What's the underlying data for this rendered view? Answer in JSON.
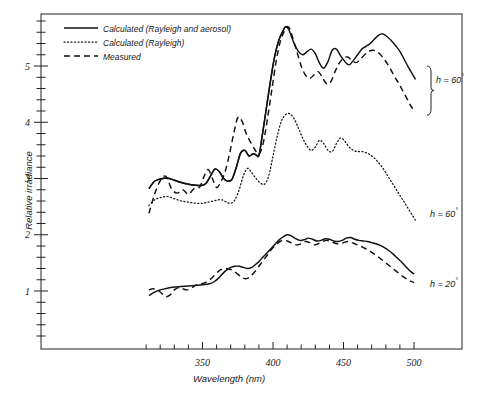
{
  "chart_data": {
    "type": "line",
    "title": "",
    "xlabel": "Wavelength (nm)",
    "ylabel": "Relative irradiance",
    "xlim": [
      310,
      505
    ],
    "ylim": [
      0,
      5.9
    ],
    "xticks_labeled": [
      350,
      400,
      450,
      500
    ],
    "xtick_labels": [
      "350",
      "400",
      "450",
      "500"
    ],
    "xtick_step_minor": 10,
    "yticks_labeled": [
      1,
      2,
      3,
      4,
      5
    ],
    "ytick_labels": [
      "1",
      "2",
      "3",
      "4",
      "5"
    ],
    "ytick_step_minor": 0.2,
    "grid": false,
    "legend_position": "top-left",
    "legend": [
      {
        "key": "calc_rayleigh_aerosol",
        "label": "Calculated (Rayleigh and  aerosol)",
        "style": "solid"
      },
      {
        "key": "calc_rayleigh",
        "label": "Calculated  (Rayleigh)",
        "style": "dotted"
      },
      {
        "key": "measured",
        "label": "Measured",
        "style": "dashed"
      }
    ],
    "annotations": [
      {
        "name": "group-label-top",
        "text": "h = 60",
        "superscript": "°",
        "bracket": true
      },
      {
        "name": "group-label-middle",
        "text": "h = 60",
        "superscript": "°",
        "bracket": false
      },
      {
        "name": "group-label-bottom",
        "text": "h = 20",
        "superscript": "°",
        "bracket": false
      }
    ],
    "series": [
      {
        "name": "h=60 Calculated (Rayleigh and aerosol)",
        "group": "h60-upper",
        "style": "solid",
        "x": [
          312,
          316,
          320,
          325,
          330,
          335,
          340,
          345,
          350,
          353,
          356,
          359,
          362,
          365,
          368,
          371,
          374,
          377,
          380,
          383,
          386,
          388,
          390,
          392,
          395,
          398,
          401,
          404,
          407,
          409,
          411,
          413,
          415,
          418,
          421,
          424,
          427,
          430,
          433,
          436,
          439,
          442,
          445,
          448,
          451,
          454,
          457,
          460,
          463,
          466,
          469,
          472,
          475,
          478,
          481,
          484,
          487,
          490,
          493,
          496,
          499,
          501
        ],
        "y": [
          2.82,
          2.95,
          2.99,
          3.01,
          2.97,
          2.93,
          2.9,
          2.88,
          2.88,
          2.93,
          3.06,
          3.17,
          3.12,
          3.0,
          2.95,
          2.99,
          3.2,
          3.45,
          3.5,
          3.4,
          3.44,
          3.42,
          3.41,
          3.7,
          4.2,
          4.7,
          5.15,
          5.45,
          5.62,
          5.7,
          5.66,
          5.53,
          5.4,
          5.26,
          5.2,
          5.25,
          5.3,
          5.22,
          5.05,
          4.96,
          5.08,
          5.28,
          5.3,
          5.18,
          5.08,
          5.02,
          5.1,
          5.2,
          5.3,
          5.35,
          5.4,
          5.48,
          5.55,
          5.57,
          5.52,
          5.45,
          5.36,
          5.26,
          5.12,
          4.98,
          4.85,
          4.76
        ]
      },
      {
        "name": "h=60 Measured",
        "group": "h60-upper",
        "style": "dashed",
        "x": [
          312,
          316,
          320,
          324,
          328,
          332,
          336,
          340,
          344,
          348,
          351,
          354,
          357,
          360,
          363,
          366,
          369,
          372,
          375,
          378,
          381,
          384,
          387,
          390,
          393,
          396,
          399,
          402,
          405,
          408,
          410,
          412,
          414,
          417,
          420,
          423,
          426,
          429,
          432,
          435,
          438,
          441,
          444,
          447,
          450,
          453,
          456,
          459,
          462,
          465,
          468,
          471,
          474,
          477,
          480,
          483,
          486,
          489,
          492,
          495,
          498,
          501
        ],
        "y": [
          2.38,
          2.72,
          2.96,
          3.04,
          2.82,
          2.74,
          2.8,
          2.72,
          2.82,
          2.85,
          3.03,
          3.16,
          3.0,
          2.84,
          2.94,
          3.12,
          3.42,
          3.78,
          4.08,
          4.02,
          3.8,
          3.65,
          3.52,
          3.43,
          3.62,
          4.05,
          4.55,
          5.05,
          5.42,
          5.62,
          5.7,
          5.66,
          5.5,
          5.25,
          5.0,
          4.84,
          4.78,
          4.84,
          4.9,
          4.8,
          4.68,
          4.72,
          4.9,
          5.05,
          5.14,
          5.16,
          5.1,
          5.06,
          5.12,
          5.2,
          5.26,
          5.28,
          5.25,
          5.18,
          5.08,
          4.96,
          4.82,
          4.7,
          4.56,
          4.42,
          4.28,
          4.18
        ]
      },
      {
        "name": "h=60 Calculated (Rayleigh and aerosol) lower",
        "group": "h60-lower",
        "style": "solid",
        "x": [
          312,
          316,
          320,
          325,
          330,
          335,
          340,
          345,
          350,
          353,
          356,
          359,
          362,
          365,
          368,
          371,
          374,
          377,
          380,
          383,
          386,
          388,
          390,
          392,
          395,
          398,
          401,
          404,
          407,
          409,
          411
        ],
        "y": [
          2.82,
          2.95,
          2.99,
          3.01,
          2.97,
          2.93,
          2.9,
          2.88,
          2.88,
          2.93,
          3.06,
          3.17,
          3.12,
          3.0,
          2.95,
          2.99,
          3.2,
          3.45,
          3.5,
          3.4,
          3.44,
          3.42,
          3.41,
          3.7,
          4.2,
          4.7,
          5.15,
          5.45,
          5.62,
          5.7,
          5.66
        ]
      },
      {
        "name": "h=60 Calculated (Rayleigh)",
        "group": "h60-middle",
        "style": "dotted",
        "x": [
          312,
          316,
          320,
          325,
          330,
          335,
          340,
          345,
          350,
          354,
          358,
          361,
          364,
          367,
          370,
          373,
          376,
          379,
          382,
          385,
          388,
          391,
          394,
          397,
          400,
          403,
          406,
          409,
          412,
          415,
          418,
          421,
          424,
          427,
          430,
          433,
          436,
          439,
          442,
          445,
          448,
          451,
          454,
          457,
          460,
          463,
          466,
          469,
          472,
          475,
          478,
          481,
          484,
          487,
          490,
          493,
          496,
          499,
          501
        ],
        "y": [
          2.52,
          2.62,
          2.66,
          2.68,
          2.64,
          2.6,
          2.58,
          2.56,
          2.56,
          2.58,
          2.6,
          2.62,
          2.62,
          2.58,
          2.56,
          2.62,
          2.8,
          3.05,
          3.18,
          3.1,
          3.0,
          2.92,
          2.9,
          3.05,
          3.4,
          3.75,
          4.02,
          4.14,
          4.15,
          4.06,
          3.9,
          3.72,
          3.58,
          3.5,
          3.56,
          3.68,
          3.62,
          3.5,
          3.48,
          3.62,
          3.72,
          3.66,
          3.56,
          3.5,
          3.48,
          3.48,
          3.46,
          3.42,
          3.36,
          3.28,
          3.18,
          3.06,
          2.94,
          2.82,
          2.7,
          2.58,
          2.46,
          2.34,
          2.26
        ]
      },
      {
        "name": "h=20 Calculated (Rayleigh and aerosol)",
        "group": "h20",
        "style": "solid",
        "x": [
          312,
          316,
          320,
          325,
          330,
          335,
          340,
          345,
          350,
          355,
          358,
          361,
          364,
          367,
          370,
          373,
          376,
          379,
          382,
          385,
          388,
          390,
          392,
          395,
          398,
          401,
          404,
          407,
          410,
          413,
          416,
          419,
          422,
          425,
          428,
          431,
          434,
          437,
          440,
          443,
          446,
          449,
          452,
          455,
          458,
          461,
          464,
          467,
          470,
          473,
          476,
          479,
          482,
          485,
          488,
          491,
          494,
          497,
          500
        ],
        "y": [
          0.92,
          0.98,
          1.02,
          1.05,
          1.07,
          1.08,
          1.09,
          1.1,
          1.11,
          1.13,
          1.16,
          1.22,
          1.3,
          1.37,
          1.42,
          1.44,
          1.44,
          1.42,
          1.4,
          1.42,
          1.48,
          1.52,
          1.58,
          1.66,
          1.74,
          1.82,
          1.9,
          1.96,
          2.0,
          1.98,
          1.93,
          1.9,
          1.91,
          1.94,
          1.92,
          1.89,
          1.9,
          1.93,
          1.92,
          1.89,
          1.88,
          1.9,
          1.94,
          1.95,
          1.92,
          1.9,
          1.89,
          1.88,
          1.86,
          1.84,
          1.81,
          1.77,
          1.72,
          1.66,
          1.59,
          1.52,
          1.44,
          1.36,
          1.3
        ]
      },
      {
        "name": "h=20 Measured",
        "group": "h20",
        "style": "dashed",
        "x": [
          312,
          315,
          318,
          321,
          324,
          327,
          330,
          333,
          336,
          339,
          342,
          345,
          348,
          351,
          354,
          357,
          360,
          363,
          366,
          369,
          372,
          375,
          378,
          381,
          384,
          387,
          390,
          393,
          396,
          399,
          402,
          405,
          408,
          411,
          414,
          417,
          420,
          423,
          426,
          429,
          432,
          435,
          438,
          441,
          444,
          447,
          450,
          453,
          456,
          459,
          462,
          465,
          468,
          471,
          474,
          477,
          480,
          483,
          486,
          489,
          492,
          495,
          498,
          500
        ],
        "y": [
          1.02,
          1.04,
          1.02,
          0.96,
          0.9,
          0.93,
          1.02,
          1.06,
          1.04,
          1.02,
          1.05,
          1.1,
          1.12,
          1.14,
          1.18,
          1.24,
          1.32,
          1.38,
          1.4,
          1.39,
          1.36,
          1.3,
          1.24,
          1.22,
          1.26,
          1.34,
          1.44,
          1.54,
          1.64,
          1.74,
          1.82,
          1.88,
          1.9,
          1.88,
          1.84,
          1.82,
          1.84,
          1.88,
          1.86,
          1.82,
          1.84,
          1.88,
          1.9,
          1.88,
          1.85,
          1.84,
          1.86,
          1.88,
          1.86,
          1.83,
          1.8,
          1.76,
          1.72,
          1.67,
          1.62,
          1.56,
          1.5,
          1.44,
          1.38,
          1.32,
          1.26,
          1.21,
          1.17,
          1.15
        ]
      }
    ]
  }
}
